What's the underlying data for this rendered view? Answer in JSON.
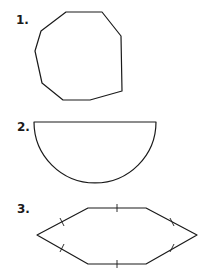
{
  "problems": [
    {
      "number": "1.",
      "shape": "irregular-nonagon"
    },
    {
      "number": "2.",
      "shape": "semicircle"
    },
    {
      "number": "3.",
      "shape": "hexagon-with-congruence-marks"
    }
  ],
  "colors": {
    "stroke": "#1a1a1a",
    "background": "#ffffff"
  }
}
